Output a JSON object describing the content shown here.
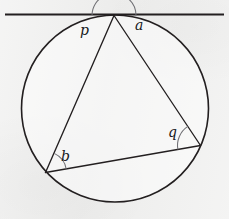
{
  "figure": {
    "background_color": "#efefee",
    "stroke_color": "#231f20",
    "canvas": {
      "width": 229,
      "height": 219
    }
  },
  "geometry": {
    "circle": {
      "cx": 115,
      "cy": 108.5,
      "r": 93.5,
      "stroke_width": 1.6
    },
    "tangent_line": {
      "name": "tangent",
      "x1": 5,
      "y1": 14.5,
      "x2": 224,
      "y2": 14.5,
      "stroke_width": 2.1
    },
    "points": {
      "apex": {
        "label": "T",
        "x": 114,
        "y": 15.5
      },
      "bottom_left": {
        "label": "B",
        "x": 45.5,
        "y": 172.5
      },
      "right": {
        "label": "C",
        "x": 200.5,
        "y": 145.5
      }
    },
    "chords": [
      {
        "name": "chord-apex-bottomleft",
        "x1": 114,
        "y1": 15.5,
        "x2": 45.5,
        "y2": 172.5,
        "stroke_width": 1.35
      },
      {
        "name": "chord-apex-right",
        "x1": 114,
        "y1": 15.5,
        "x2": 200.5,
        "y2": 145.5,
        "stroke_width": 1.35
      },
      {
        "name": "chord-bottomleft-right",
        "x1": 45.5,
        "y1": 172.5,
        "x2": 200.5,
        "y2": 145.5,
        "stroke_width": 1.35
      }
    ]
  },
  "angles": [
    {
      "id": "p",
      "label": "p",
      "vertex": "apex",
      "description": "angle between tangent (left ray) and chord to bottom-left vertex",
      "arc": {
        "cx": 114,
        "cy": 15.5,
        "radius": 22,
        "start_deg": 180,
        "end_deg": 246
      },
      "label_pos": {
        "x": 80,
        "y": 23
      }
    },
    {
      "id": "a",
      "label": "a",
      "vertex": "apex",
      "description": "angle between chord to right vertex and tangent (right ray)",
      "arc": {
        "cx": 114,
        "cy": 15.5,
        "radius": 22,
        "start_deg": 303.5,
        "end_deg": 360
      },
      "label_pos": {
        "x": 135,
        "y": 18
      }
    },
    {
      "id": "b",
      "label": "b",
      "vertex": "bottom_left",
      "description": "inscribed angle at bottom-left vertex between chord to apex and chord to right vertex",
      "arc": {
        "cx": 45.5,
        "cy": 172.5,
        "radius": 21,
        "start_deg": 294.5,
        "end_deg": 350
      },
      "label_pos": {
        "x": 61,
        "y": 149
      }
    },
    {
      "id": "q",
      "label": "q",
      "vertex": "right",
      "description": "inscribed angle at right vertex between chord to apex and chord to bottom-left vertex",
      "arc": {
        "cx": 200.5,
        "cy": 145.5,
        "radius": 23,
        "start_deg": 170,
        "end_deg": 236.5
      },
      "label_pos": {
        "x": 168,
        "y": 125
      }
    }
  ]
}
